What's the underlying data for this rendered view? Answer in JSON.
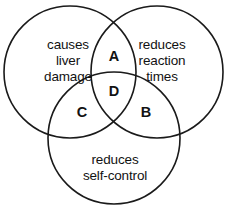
{
  "diagram": {
    "type": "venn",
    "sets": [
      {
        "id": "left",
        "label": "causes\nliver\ndamage",
        "cx": 70,
        "cy": 72,
        "r": 66
      },
      {
        "id": "right",
        "label": "reduces\nreaction\ntimes",
        "cx": 157,
        "cy": 72,
        "r": 66
      },
      {
        "id": "bottom",
        "label": "reduces\nself-control",
        "cx": 114,
        "cy": 138,
        "r": 66
      }
    ],
    "regions": [
      {
        "id": "a",
        "label": "A",
        "members": [
          "left",
          "right"
        ]
      },
      {
        "id": "b",
        "label": "B",
        "members": [
          "right",
          "bottom"
        ]
      },
      {
        "id": "c",
        "label": "C",
        "members": [
          "left",
          "bottom"
        ]
      },
      {
        "id": "d",
        "label": "D",
        "members": [
          "left",
          "right",
          "bottom"
        ]
      }
    ],
    "colors": {
      "background": "#ffffff",
      "stroke": "#1a1a1a",
      "text": "#121212"
    }
  }
}
